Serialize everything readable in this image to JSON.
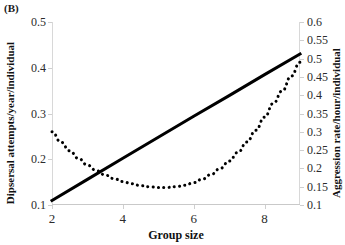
{
  "panel": {
    "label": "(B)"
  },
  "chart_data": {
    "type": "line",
    "title": "",
    "panel_label": "(B)",
    "xlabel": "Group size",
    "ylabel": "Dipsersal attempts/year/individual",
    "ylabel_secondary": "Aggression rate/hour/individual",
    "xlim": [
      2,
      9
    ],
    "ylim": [
      0.1,
      0.5
    ],
    "ylim_secondary": [
      0.1,
      0.6
    ],
    "xticks": [
      2,
      4,
      6,
      8
    ],
    "xtick_labels": [
      "2",
      "4",
      "6",
      "8"
    ],
    "yticks": [
      0.1,
      0.2,
      0.3,
      0.4,
      0.5
    ],
    "ytick_labels": [
      "0.1",
      "0.2",
      "0.3",
      "0.4",
      "0.5"
    ],
    "yticks_secondary": [
      0.1,
      0.15,
      0.2,
      0.25,
      0.3,
      0.35,
      0.4,
      0.45,
      0.5,
      0.55,
      0.6
    ],
    "ytick_labels_secondary": [
      "0.1",
      "0.15",
      "0.2",
      "0.25",
      "0.3",
      "0.35",
      "0.4",
      "0.45",
      "0.5",
      "0.55",
      "0.6"
    ],
    "grid": false,
    "legend": null,
    "series": [
      {
        "name": "Dispersal attempts/year/individual",
        "axis": "left",
        "style": "solid",
        "color": "#000000",
        "linewidth": 3,
        "x": [
          2,
          3,
          4,
          5,
          6,
          7,
          8,
          9
        ],
        "values": [
          0.11,
          0.156,
          0.202,
          0.248,
          0.294,
          0.339,
          0.385,
          0.43
        ]
      },
      {
        "name": "Aggression rate/hour/individual",
        "axis": "right",
        "style": "dotted",
        "color": "#000000",
        "linewidth": 3,
        "x": [
          2,
          2.25,
          2.5,
          2.75,
          3,
          3.25,
          3.5,
          3.75,
          4,
          4.25,
          4.5,
          4.75,
          5,
          5.25,
          5.5,
          5.75,
          6,
          6.25,
          6.5,
          6.75,
          7,
          7.25,
          7.5,
          7.75,
          8,
          8.25,
          8.5,
          8.75,
          9
        ],
        "values": [
          0.3,
          0.272,
          0.248,
          0.227,
          0.209,
          0.194,
          0.182,
          0.172,
          0.164,
          0.158,
          0.153,
          0.15,
          0.148,
          0.148,
          0.15,
          0.154,
          0.161,
          0.171,
          0.184,
          0.2,
          0.22,
          0.244,
          0.272,
          0.304,
          0.34,
          0.378,
          0.412,
          0.452,
          0.49
        ]
      }
    ]
  }
}
